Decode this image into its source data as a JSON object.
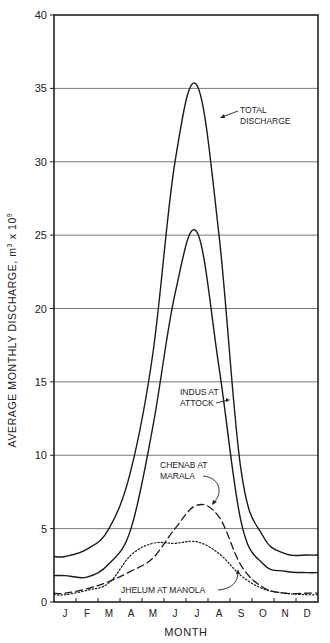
{
  "chart_data": {
    "type": "line",
    "title": "",
    "xlabel": "MONTH",
    "ylabel": "AVERAGE MONTHLY DISCHARGE, m³ x 10⁹",
    "ylim": [
      0,
      40
    ],
    "yticks": [
      0,
      5,
      10,
      15,
      20,
      25,
      30,
      35,
      40
    ],
    "ytick_labels": [
      "0",
      "5",
      "10",
      "15",
      "20",
      "25",
      "30",
      "35",
      "40"
    ],
    "grid": "horizontal",
    "categories": [
      "J",
      "F",
      "M",
      "A",
      "M",
      "J",
      "J",
      "A",
      "S",
      "O",
      "N",
      "D"
    ],
    "series": [
      {
        "name": "TOTAL DISCHARGE",
        "style": "solid",
        "values": [
          3.1,
          3.6,
          5.0,
          9.0,
          17.0,
          30.0,
          35.2,
          25.0,
          9.0,
          4.5,
          3.3,
          3.2
        ]
      },
      {
        "name": "INDUS AT ATTOCK",
        "style": "solid",
        "values": [
          1.8,
          1.7,
          2.6,
          5.0,
          12.0,
          21.0,
          25.2,
          16.0,
          5.5,
          2.6,
          2.1,
          2.0
        ]
      },
      {
        "name": "CHENAB AT MARALA",
        "style": "dashed",
        "values": [
          0.6,
          0.9,
          1.4,
          2.1,
          3.0,
          5.0,
          6.6,
          5.8,
          2.5,
          1.0,
          0.6,
          0.6
        ]
      },
      {
        "name": "JHELUM AT MANOLA",
        "style": "dotted",
        "values": [
          0.5,
          0.8,
          1.3,
          3.2,
          4.0,
          4.0,
          4.1,
          3.3,
          1.8,
          0.9,
          0.6,
          0.5
        ]
      }
    ],
    "annotations": [
      {
        "text": [
          "TOTAL",
          "DISCHARGE"
        ],
        "target": "TOTAL DISCHARGE"
      },
      {
        "text": [
          "INDUS AT",
          "ATTOCK"
        ],
        "target": "INDUS AT ATTOCK"
      },
      {
        "text": [
          "CHENAB AT",
          "MARALA"
        ],
        "target": "CHENAB AT MARALA"
      },
      {
        "text": [
          "JHELUM AT MANOLA"
        ],
        "target": "JHELUM AT MANOLA"
      }
    ]
  },
  "axis": {
    "x_title": "MONTH",
    "y_title": "AVERAGE MONTHLY DISCHARGE, m",
    "y_title_sup1": "3",
    "y_title_mid": " x 10",
    "y_title_sup2": "9"
  },
  "labels": {
    "total_1": "TOTAL",
    "total_2": "DISCHARGE",
    "indus_1": "INDUS AT",
    "indus_2": "ATTOCK",
    "chenab_1": "CHENAB AT",
    "chenab_2": "MARALA",
    "jhelum": "JHELUM AT MANOLA"
  }
}
